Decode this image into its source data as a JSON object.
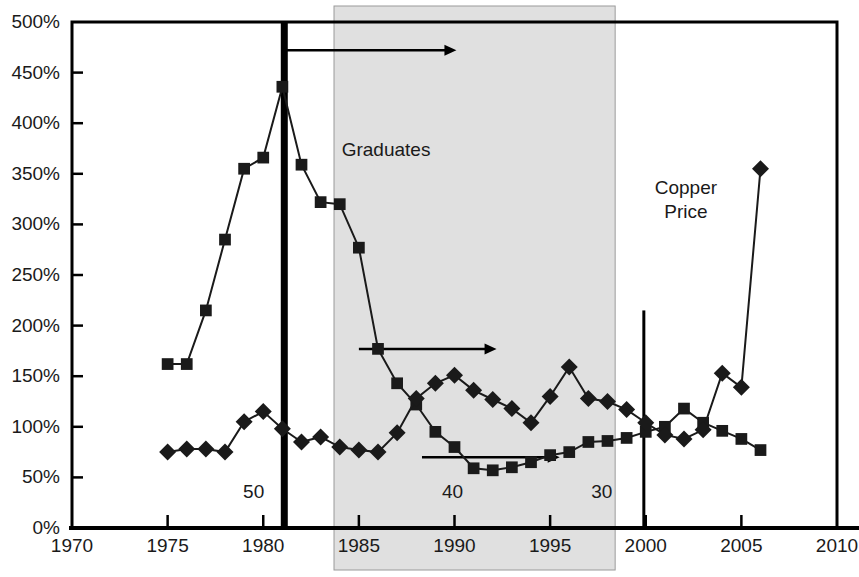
{
  "chart_data": {
    "type": "line",
    "title": "",
    "subtitle": "",
    "xlabel": "",
    "ylabel": "",
    "xlim": [
      1970,
      2010
    ],
    "ylim": [
      0,
      500
    ],
    "xticks": [
      1970,
      1975,
      1980,
      1985,
      1990,
      1995,
      2000,
      2005,
      2010
    ],
    "xtick_labels": [
      "1970",
      "1975",
      "1980",
      "1985",
      "1990",
      "1995",
      "2000",
      "2005",
      "2010"
    ],
    "yticks": [
      0,
      50,
      100,
      150,
      200,
      250,
      300,
      350,
      400,
      450,
      500
    ],
    "ytick_labels": [
      "0%",
      "50%",
      "100%",
      "150%",
      "200%",
      "250%",
      "300%",
      "350%",
      "400%",
      "450%",
      "500%"
    ],
    "grid": false,
    "legend_position": "inline-annotations",
    "series": [
      {
        "name": "Graduates",
        "marker": "square",
        "label_text": "Graduates",
        "label_x": 1984.1,
        "label_y": 368,
        "x": [
          1975,
          1976,
          1977,
          1978,
          1979,
          1980,
          1981,
          1982,
          1983,
          1984,
          1985,
          1986,
          1987,
          1988,
          1989,
          1990,
          1991,
          1992,
          1993,
          1994,
          1995,
          1996,
          1997,
          1998,
          1999,
          2000,
          2001,
          2002,
          2003,
          2004,
          2005,
          2006
        ],
        "values": [
          162,
          162,
          215,
          285,
          355,
          366,
          436,
          359,
          322,
          320,
          277,
          177,
          143,
          122,
          95,
          80,
          59,
          57,
          60,
          65,
          72,
          75,
          85,
          86,
          89,
          95,
          100,
          118,
          104,
          96,
          88,
          77
        ]
      },
      {
        "name": "Copper Price",
        "marker": "diamond",
        "label_text": "Copper\nPrice",
        "label_x": 2002.1,
        "label_y": 330,
        "x": [
          1975,
          1976,
          1977,
          1978,
          1979,
          1980,
          1981,
          1982,
          1983,
          1984,
          1985,
          1986,
          1987,
          1988,
          1989,
          1990,
          1991,
          1992,
          1993,
          1994,
          1995,
          1996,
          1997,
          1998,
          1999,
          2000,
          2001,
          2002,
          2003,
          2004,
          2005,
          2006
        ],
        "values": [
          75,
          78,
          78,
          75,
          105,
          115,
          98,
          85,
          90,
          80,
          77,
          75,
          94,
          128,
          143,
          151,
          136,
          127,
          118,
          104,
          130,
          159,
          128,
          125,
          117,
          104,
          92,
          88,
          97,
          153,
          139,
          355
        ]
      }
    ],
    "shaded_region": {
      "x_start": 1983.7,
      "x_end": 1998.4,
      "color": "#e0e0e0"
    },
    "vertical_lines": [
      {
        "name": "thick-marker-1981",
        "x": 1981.1,
        "y_from": 0,
        "y_to": 500,
        "width": 7,
        "color": "#000000"
      },
      {
        "name": "thin-marker-2000",
        "x": 1999.9,
        "y_from": 0,
        "y_to": 215,
        "width": 3,
        "color": "#000000"
      }
    ],
    "annotations": [
      {
        "name": "annot-50",
        "text": "50",
        "x": 1979.5,
        "y": 30
      },
      {
        "name": "annot-40",
        "text": "40",
        "x": 1989.9,
        "y": 30
      },
      {
        "name": "annot-30",
        "text": "30",
        "x": 1997.7,
        "y": 30
      }
    ],
    "arrows": [
      {
        "name": "arrow-top",
        "x_start": 1981.1,
        "x_end": 1990.1,
        "y": 472
      },
      {
        "name": "arrow-middle",
        "x_start": 1985.0,
        "x_end": 1992.2,
        "y": 177
      },
      {
        "name": "arrow-bottom",
        "x_start": 1988.3,
        "x_end": 1995.5,
        "y": 70
      }
    ]
  },
  "colors": {
    "series_ink": "#1a1a1a",
    "axis": "#000000",
    "shaded_band": "#e0e0e0",
    "background": "#ffffff"
  }
}
